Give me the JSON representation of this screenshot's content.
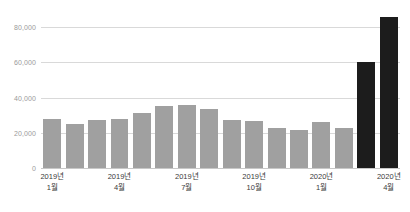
{
  "chart_data": {
    "type": "bar",
    "title": "",
    "subtitle": "",
    "xlabel": "",
    "ylabel": "",
    "ylim": [
      0,
      88000
    ],
    "grid": true,
    "legend": null,
    "categories": [
      "2019년 1월",
      "2019년 2월",
      "2019년 3월",
      "2019년 4월",
      "2019년 5월",
      "2019년 6월",
      "2019년 7월",
      "2019년 8월",
      "2019년 9월",
      "2019년 10월",
      "2019년 11월",
      "2019년 12월",
      "2020년 1월",
      "2020년 2월",
      "2020년 3월",
      "2020년 4월"
    ],
    "values": [
      28000,
      25000,
      27000,
      28000,
      31500,
      35000,
      36000,
      33500,
      27500,
      26500,
      22500,
      21500,
      26000,
      22500,
      60000,
      86000
    ],
    "highlight_indices": [
      14,
      15
    ],
    "colors": {
      "bar": "#a0a0a0",
      "bar_highlight": "#1c1c1c",
      "gridline": "#d9d9d9",
      "baseline": "#c8c8c8",
      "y_label": "#9a9a9a",
      "x_label": "#3a3a3a",
      "background": "#ffffff"
    },
    "y_ticks": [
      {
        "value": 0,
        "label": "0"
      },
      {
        "value": 20000,
        "label": "20,000"
      },
      {
        "value": 40000,
        "label": "40,000"
      },
      {
        "value": 60000,
        "label": "60,000"
      },
      {
        "value": 80000,
        "label": "80,000"
      }
    ],
    "x_ticks": [
      {
        "index": 0,
        "year": "2019년",
        "month": "1월"
      },
      {
        "index": 3,
        "year": "2019년",
        "month": "4월"
      },
      {
        "index": 6,
        "year": "2019년",
        "month": "7월"
      },
      {
        "index": 9,
        "year": "2019년",
        "month": "10월"
      },
      {
        "index": 12,
        "year": "2020년",
        "month": "1월"
      },
      {
        "index": 15,
        "year": "2020년",
        "month": "4월"
      }
    ]
  }
}
